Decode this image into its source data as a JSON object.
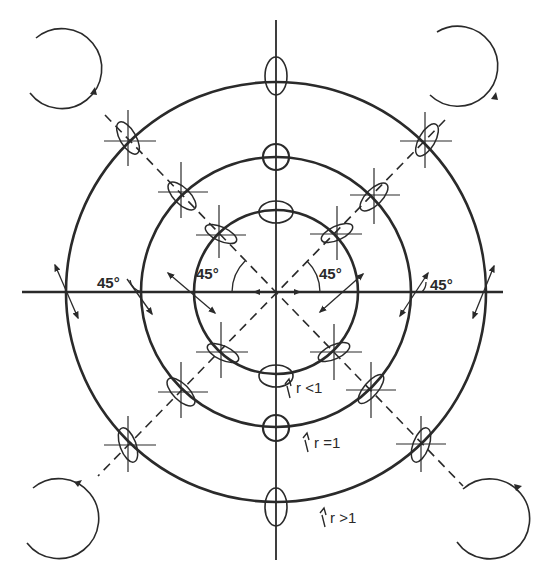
{
  "diagram": {
    "colors": {
      "stroke": "#2a2a2a",
      "background": "#ffffff"
    },
    "center": {
      "x": 276,
      "y": 292
    },
    "axes": {
      "horizontal": {
        "x1": 22,
        "x2": 503
      },
      "vertical": {
        "y1": 20,
        "y2": 560
      }
    },
    "circles": [
      {
        "id": "inner",
        "r": 82,
        "label": "r <1",
        "label_x": 296,
        "label_y": 393
      },
      {
        "id": "middle",
        "r": 135,
        "label": "r =1",
        "label_x": 314,
        "label_y": 448
      },
      {
        "id": "outer",
        "r": 210,
        "label": "r >1",
        "label_x": 330,
        "label_y": 523
      }
    ],
    "angle_labels": [
      {
        "text": "45°",
        "x": 208,
        "y": 333
      },
      {
        "text": "45°",
        "x": 321,
        "y": 333
      },
      {
        "text": "45°",
        "x": 98,
        "y": 288
      },
      {
        "text": "45°",
        "x": 430,
        "y": 290
      }
    ],
    "corner_arcs": [
      {
        "name": "top-left",
        "cx": 63,
        "cy": 67,
        "r": 40
      },
      {
        "name": "top-right",
        "cx": 463,
        "cy": 63,
        "r": 40
      },
      {
        "name": "bottom-left",
        "cx": 58,
        "cy": 517,
        "r": 40
      },
      {
        "name": "bottom-right",
        "cx": 488,
        "cy": 520,
        "r": 40
      }
    ]
  }
}
